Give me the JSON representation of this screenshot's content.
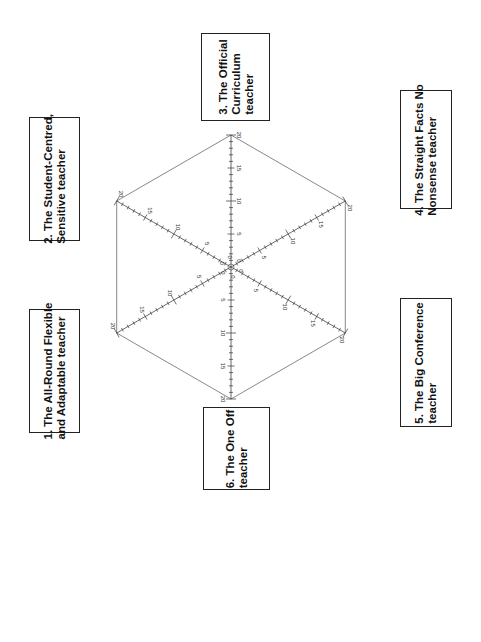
{
  "diagram": {
    "center": {
      "x": 231,
      "y": 267
    },
    "radius": 132,
    "scale_max": 20,
    "major_tick_every": 5,
    "minor_tick_every": 1,
    "tick_labels": [
      "0",
      "5",
      "10",
      "15",
      "20"
    ],
    "line_color": "#444444",
    "axes": [
      {
        "id": 1,
        "label": "1. The All-Round Flexible and Adaptable teacher",
        "angle_deg": 210
      },
      {
        "id": 2,
        "label": "2. The Student-Centred, Sensitive teacher",
        "angle_deg": 150
      },
      {
        "id": 3,
        "label": "3. The Official Curriculum teacher",
        "angle_deg": 90
      },
      {
        "id": 4,
        "label": "4. The Straight Facts No Nonsense teacher",
        "angle_deg": 30
      },
      {
        "id": 5,
        "label": "5. The Big Conference teacher",
        "angle_deg": -30
      },
      {
        "id": 6,
        "label": "6. The One Off teacher",
        "angle_deg": -90
      }
    ]
  },
  "boxes": {
    "box1": {
      "line1": "1. The All-Round Flexible",
      "line2": "and Adaptable teacher"
    },
    "box2": {
      "line1": "2. The Student-Centred,",
      "line2": "Sensitive teacher"
    },
    "box3": {
      "line1": "3. The Official",
      "line2": "Curriculum",
      "line3": "teacher"
    },
    "box4": {
      "line1": "4. The Straight Facts No",
      "line2": "Nonsense teacher"
    },
    "box5": {
      "line1": "5. The Big Conference",
      "line2": "teacher"
    },
    "box6": {
      "line1": "6. The One Off",
      "line2": "teacher"
    }
  }
}
